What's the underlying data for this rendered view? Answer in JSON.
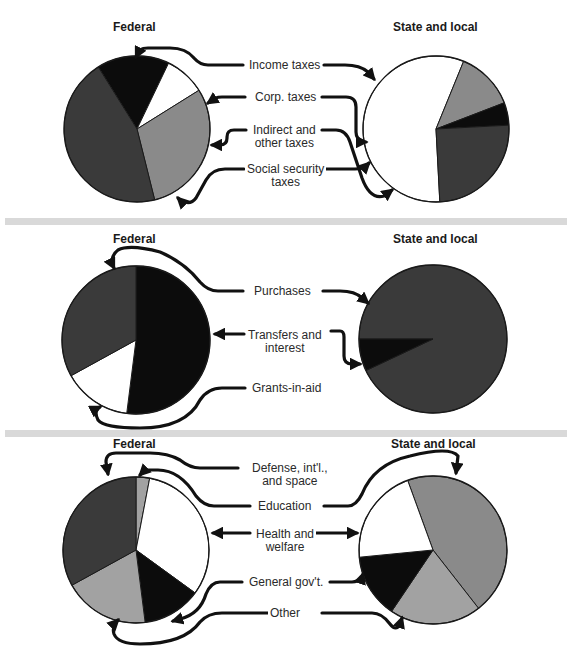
{
  "colors": {
    "dark_gray": "#3a3a3a",
    "black": "#0c0c0c",
    "white": "#ffffff",
    "mid_gray": "#8a8a8a",
    "light_gray": "#a2a2a2",
    "separator": "#d9d9d9"
  },
  "panels": [
    {
      "federal_title": "Federal",
      "state_title": "State and local",
      "labels": [
        "Income taxes",
        "Corp. taxes",
        "Indirect and\nother taxes",
        "Social security\ntaxes"
      ]
    },
    {
      "federal_title": "Federal",
      "state_title": "State and local",
      "labels": [
        "Purchases",
        "Transfers and\ninterest",
        "Grants-in-aid"
      ]
    },
    {
      "federal_title": "Federal",
      "state_title": "State and local",
      "labels": [
        "Defense, int'l.,\nand space",
        "Education",
        "Health and\nwelfare",
        "General gov't.",
        "Other"
      ]
    }
  ],
  "chart_data": [
    {
      "type": "pie",
      "title": "Federal receipts",
      "categories": [
        "Income taxes",
        "Corp. taxes",
        "Indirect and other taxes",
        "Social security taxes"
      ],
      "values": [
        45,
        16,
        9,
        30
      ],
      "start_angle_deg": 328,
      "order_clockwise": [
        "Corp. taxes",
        "Indirect and other taxes",
        "Social security taxes",
        "Income taxes"
      ],
      "fills": {
        "Income taxes": "dark_gray",
        "Corp. taxes": "black",
        "Indirect and other taxes": "white",
        "Social security taxes": "mid_gray"
      }
    },
    {
      "type": "pie",
      "title": "State and local receipts",
      "categories": [
        "Income taxes",
        "Corp. taxes",
        "Indirect and other taxes",
        "Social security taxes"
      ],
      "values": [
        25,
        5,
        57,
        13
      ],
      "start_angle_deg": 177,
      "order_clockwise": [
        "Indirect and other taxes",
        "Social security taxes",
        "Corp. taxes",
        "Income taxes"
      ],
      "fills": {
        "Income taxes": "dark_gray",
        "Corp. taxes": "black",
        "Indirect and other taxes": "white",
        "Social security taxes": "mid_gray"
      }
    },
    {
      "type": "pie",
      "title": "Federal expenditures",
      "categories": [
        "Purchases",
        "Transfers and interest",
        "Grants-in-aid"
      ],
      "values": [
        33,
        52,
        15
      ],
      "start_angle_deg": 0,
      "order_clockwise": [
        "Transfers and interest",
        "Grants-in-aid",
        "Purchases"
      ],
      "fills": {
        "Purchases": "dark_gray",
        "Transfers and interest": "black",
        "Grants-in-aid": "white"
      }
    },
    {
      "type": "pie",
      "title": "State and local expenditures",
      "categories": [
        "Purchases",
        "Transfers and interest",
        "Grants-in-aid"
      ],
      "values": [
        93,
        7,
        0
      ],
      "start_angle_deg": 270,
      "order_clockwise": [
        "Purchases",
        "Transfers and interest"
      ],
      "fills": {
        "Purchases": "dark_gray",
        "Transfers and interest": "black",
        "Grants-in-aid": "white"
      }
    },
    {
      "type": "pie",
      "title": "Federal expenditures by function",
      "categories": [
        "Defense, int'l., and space",
        "Education",
        "Health and welfare",
        "General gov't.",
        "Other"
      ],
      "values": [
        33,
        3,
        32,
        13,
        19
      ],
      "start_angle_deg": 0,
      "order_clockwise": [
        "Education",
        "Health and welfare",
        "General gov't.",
        "Other",
        "Defense, int'l., and space"
      ],
      "fills": {
        "Defense, int'l., and space": "dark_gray",
        "Education": "light_gray",
        "Health and welfare": "white",
        "General gov't.": "black",
        "Other": "light_gray"
      }
    },
    {
      "type": "pie",
      "title": "State and local expenditures by function",
      "categories": [
        "Defense, int'l., and space",
        "Education",
        "Health and welfare",
        "General gov't.",
        "Other"
      ],
      "values": [
        0,
        45,
        21,
        14,
        20
      ],
      "start_angle_deg": 340,
      "order_clockwise": [
        "Education",
        "Other",
        "General gov't.",
        "Health and welfare"
      ],
      "fills": {
        "Defense, int'l., and space": "dark_gray",
        "Education": "mid_gray",
        "Health and welfare": "white",
        "General gov't.": "black",
        "Other": "light_gray"
      }
    }
  ]
}
